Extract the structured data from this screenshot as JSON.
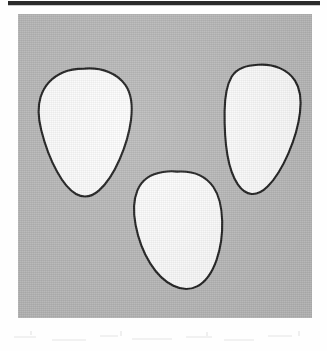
{
  "figure": {
    "caption": "",
    "panel": {
      "background_color": "#bababa",
      "border_color": "#bababa",
      "x": 18,
      "y": 14,
      "width": 294,
      "height": 304
    },
    "rule": {
      "name": "top-rule",
      "color": "#2b2b2b",
      "x": 8,
      "y": 1,
      "width": 312,
      "height": 4
    },
    "shape_style": {
      "fill_color": "#ffffff",
      "outline_color": "#1c1c1c",
      "outline_width": 2.1
    },
    "shapes": [
      {
        "id": "blob-left",
        "label": "upper-left ovoid outline",
        "position": "upper-left",
        "bbox": {
          "x": 20,
          "y": 54,
          "width": 94,
          "height": 128
        },
        "orientation": "broad rounded top, tapering narrow base"
      },
      {
        "id": "blob-right",
        "label": "upper-right teardrop outline",
        "position": "upper-right",
        "bbox": {
          "x": 204,
          "y": 50,
          "width": 79,
          "height": 130
        },
        "orientation": "rounded top, elongated tapering base"
      },
      {
        "id": "blob-center",
        "label": "lower-centre rounded oval outline",
        "position": "lower-centre",
        "bbox": {
          "x": 115,
          "y": 157,
          "width": 90,
          "height": 115
        },
        "orientation": "broad rounded oval"
      }
    ],
    "shape_count": 3,
    "artifacts": {
      "description": "faint residual scan speckle below panel",
      "color": "#efefef"
    }
  }
}
